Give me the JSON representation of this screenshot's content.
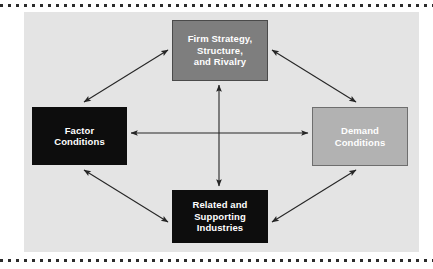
{
  "figure": {
    "panel_color": "#e4e4e4",
    "page_color": "#ffffff",
    "rule_color": "#2b2b2b",
    "arrow_color": "#262626"
  },
  "nodes": [
    {
      "id": "firm-strategy-structure-and-rivalry",
      "text": "Firm Strategy,\nStructure,\nand Rivalry",
      "lines": [
        "Firm Strategy,",
        "Structure,",
        "and Rivalry"
      ],
      "fill": "#7e7e7e",
      "border": "#4a4a4a",
      "text_color": "#ffffff",
      "position": "top"
    },
    {
      "id": "factor-conditions",
      "text": "Factor\nConditions",
      "lines": [
        "Factor",
        "Conditions"
      ],
      "fill": "#0d0d0d",
      "border": "#0d0d0d",
      "text_color": "#ffffff",
      "position": "left"
    },
    {
      "id": "demand-conditions",
      "text": "Demand\nConditions",
      "lines": [
        "Demand",
        "Conditions"
      ],
      "fill": "#b2b2b2",
      "border": "#6e6e6e",
      "text_color": "#ffffff",
      "position": "right"
    },
    {
      "id": "related-and-supporting-industries",
      "text": "Related and\nSupporting\nIndustries",
      "lines": [
        "Related and",
        "Supporting",
        "Industries"
      ],
      "fill": "#0d0d0d",
      "border": "#0d0d0d",
      "text_color": "#ffffff",
      "position": "bottom"
    }
  ],
  "connections": [
    {
      "id": "factor-to-firm",
      "from": "factor-conditions",
      "to": "firm-strategy-structure-and-rivalry",
      "style": "double-headed"
    },
    {
      "id": "firm-to-demand",
      "from": "firm-strategy-structure-and-rivalry",
      "to": "demand-conditions",
      "style": "double-headed"
    },
    {
      "id": "factor-to-related",
      "from": "factor-conditions",
      "to": "related-and-supporting-industries",
      "style": "double-headed"
    },
    {
      "id": "related-to-demand",
      "from": "related-and-supporting-industries",
      "to": "demand-conditions",
      "style": "double-headed"
    },
    {
      "id": "factor-to-demand",
      "from": "factor-conditions",
      "to": "demand-conditions",
      "style": "double-headed"
    },
    {
      "id": "firm-to-related",
      "from": "firm-strategy-structure-and-rivalry",
      "to": "related-and-supporting-industries",
      "style": "double-headed"
    }
  ]
}
